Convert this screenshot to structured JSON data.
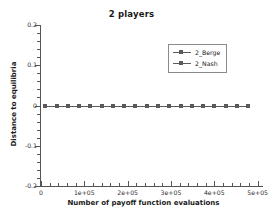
{
  "chart_data": {
    "type": "line",
    "title": "2 players",
    "xlabel": "Number of payoff function evaluations",
    "ylabel": "Distance to equilibria",
    "xlim": [
      0,
      510000
    ],
    "ylim": [
      -0.2,
      0.2
    ],
    "grid": false,
    "legend_position": "upper-right",
    "xticks": [
      0,
      100000,
      200000,
      300000,
      400000,
      500000
    ],
    "xticklabels": [
      "0",
      "1e+05",
      "2e+05",
      "3e+05",
      "4e+05",
      "5e+05"
    ],
    "yticks": [
      0.2,
      0.1,
      0,
      -0.1,
      -0.2
    ],
    "yticklabels": [
      "0.2",
      "0.1",
      "0",
      "-0.1",
      "-0.2"
    ],
    "x": [
      10000,
      36000,
      62000,
      88000,
      114000,
      140000,
      166000,
      192000,
      218000,
      244000,
      270000,
      296000,
      322000,
      348000,
      374000,
      400000,
      426000,
      452000,
      478000
    ],
    "series": [
      {
        "name": "2_Berge",
        "marker": "square",
        "color": "#5a5a5a",
        "values": [
          0,
          0,
          0,
          0,
          0,
          0,
          0,
          0,
          0,
          0,
          0,
          0,
          0,
          0,
          0,
          0,
          0,
          0,
          0
        ]
      },
      {
        "name": "2_Nash",
        "marker": "square",
        "color": "#5a5a5a",
        "values": [
          0,
          0,
          0,
          0,
          0,
          0,
          0,
          0,
          0,
          0,
          0,
          0,
          0,
          0,
          0,
          0,
          0,
          0,
          0
        ]
      }
    ]
  }
}
